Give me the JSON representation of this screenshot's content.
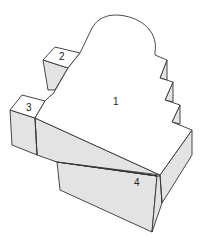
{
  "diagram": {
    "type": "isometric-block-diagram",
    "colors": {
      "top_face": "#ffffff",
      "side_face": "#e3e3e3",
      "stroke": "#333333"
    },
    "labels": [
      {
        "id": "1",
        "text": "1",
        "x": 113,
        "y": 105
      },
      {
        "id": "2",
        "text": "2",
        "x": 59,
        "y": 60
      },
      {
        "id": "3",
        "text": "3",
        "x": 27,
        "y": 110
      },
      {
        "id": "4",
        "text": "4",
        "x": 134,
        "y": 186
      }
    ]
  }
}
